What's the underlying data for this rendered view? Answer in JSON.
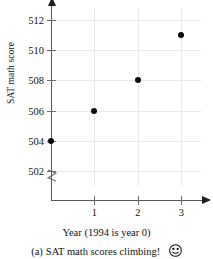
{
  "chart_data": {
    "type": "scatter",
    "title": "",
    "xlabel": "Year (1994 is year 0)",
    "ylabel": "SAT math score",
    "x": [
      0,
      1,
      2,
      3
    ],
    "values": [
      504,
      506,
      508,
      511
    ],
    "points": [
      {
        "x": 0,
        "y": 504
      },
      {
        "x": 1,
        "y": 506
      },
      {
        "x": 2,
        "y": 508
      },
      {
        "x": 3,
        "y": 511
      }
    ],
    "xlim": [
      0,
      3.45
    ],
    "ylim": [
      501,
      512.8
    ],
    "xticks": [
      1,
      2,
      3
    ],
    "xtick_labels": [
      "1",
      "2",
      "3"
    ],
    "yticks": [
      502,
      504,
      506,
      508,
      510,
      512
    ],
    "ytick_labels": [
      "502",
      "504",
      "506",
      "508",
      "510",
      "512"
    ],
    "grid": true,
    "legend": "none",
    "y_axis_break": true,
    "marker": "filled-circle",
    "marker_color": "#0a0a0a",
    "grid_color": "#e9e9e9",
    "axis_color": "#565656"
  },
  "caption": {
    "letter": "(a)",
    "text": "SAT math scores climbing!",
    "icon": "smiley-face-icon"
  }
}
